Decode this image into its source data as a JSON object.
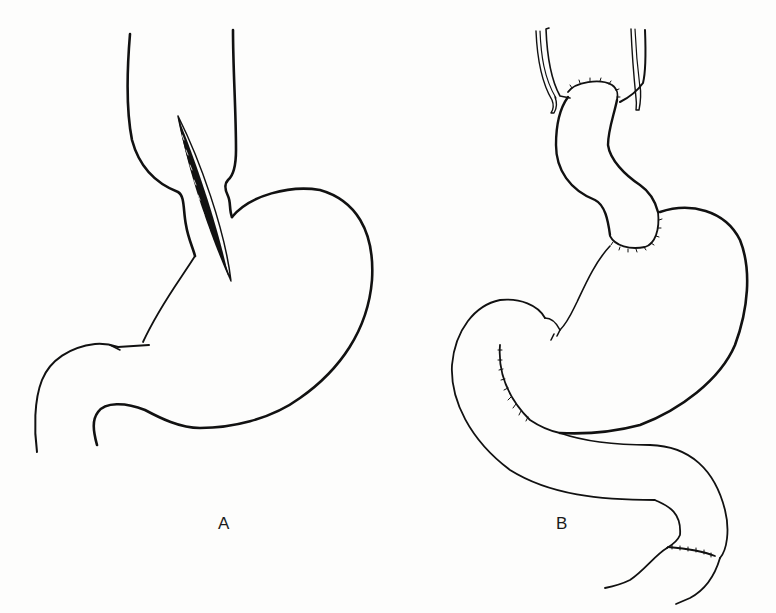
{
  "figure": {
    "panels": [
      {
        "id": "A",
        "label": "A",
        "description": "Stomach with esophagus, showing an oblique incision at the gastroesophageal junction"
      },
      {
        "id": "B",
        "label": "B",
        "description": "Reconstructed esophagus-stomach with sutured anastomoses and duodenal anastomosis"
      }
    ],
    "colors": {
      "line": "#111111",
      "background": "#fdfdfc"
    }
  }
}
